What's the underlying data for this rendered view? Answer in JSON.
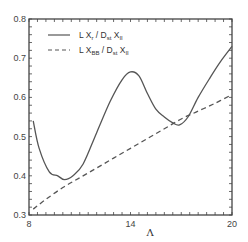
{
  "chart_data": {
    "type": "line",
    "title": "",
    "xlabel": "Λ",
    "ylabel": "",
    "xlim": [
      8,
      20
    ],
    "ylim": [
      0.3,
      0.8
    ],
    "grid": false,
    "legend_position": "upper-left",
    "x_ticks": [
      8,
      14,
      20
    ],
    "x_tick_labels": [
      "8",
      "14",
      "20"
    ],
    "y_ticks": [
      0.3,
      0.4,
      0.5,
      0.6,
      0.7,
      0.8
    ],
    "y_tick_labels": [
      "0.3",
      "0.4",
      "0.5",
      "0.6",
      "0.7",
      "0.8"
    ],
    "series": [
      {
        "name": "L X_r / D_st X_II",
        "legend_main": "L X",
        "legend_sub1": "r",
        "legend_mid": " / D",
        "legend_sub2": "st",
        "legend_end": " X",
        "legend_sub3": "II",
        "style": "solid",
        "color": "#555555",
        "x": [
          8.25,
          8.6,
          9.2,
          9.7,
          10.1,
          10.6,
          11.2,
          12.0,
          12.8,
          13.5,
          14.0,
          14.5,
          15.0,
          15.5,
          16.0,
          16.5,
          16.9,
          17.4,
          18.0,
          18.7,
          19.3,
          20.0
        ],
        "values": [
          0.54,
          0.47,
          0.41,
          0.4,
          0.39,
          0.4,
          0.43,
          0.51,
          0.59,
          0.645,
          0.665,
          0.655,
          0.61,
          0.57,
          0.55,
          0.535,
          0.53,
          0.55,
          0.6,
          0.65,
          0.69,
          0.73
        ]
      },
      {
        "name": "L X_BB / D_st X_II",
        "legend_main": "L X",
        "legend_sub1": "BB",
        "legend_mid": " / D",
        "legend_sub2": "st",
        "legend_end": " X",
        "legend_sub3": "II",
        "style": "dashed",
        "color": "#555555",
        "x": [
          8.25,
          9.0,
          10.0,
          11.0,
          12.0,
          13.0,
          14.0,
          15.0,
          16.0,
          17.0,
          18.0,
          19.0,
          19.9
        ],
        "values": [
          0.315,
          0.34,
          0.37,
          0.395,
          0.42,
          0.445,
          0.47,
          0.495,
          0.52,
          0.545,
          0.565,
          0.585,
          0.605
        ]
      }
    ]
  }
}
